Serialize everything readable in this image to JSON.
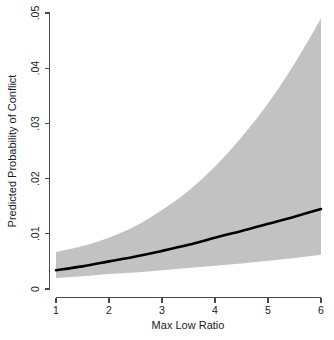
{
  "chart_data": {
    "type": "line",
    "title": "",
    "subtitle": "",
    "xlabel": "Max Low Ratio",
    "ylabel": "Predicted Probability of Conflict",
    "xlim": [
      1,
      6
    ],
    "ylim": [
      0,
      0.05
    ],
    "grid": false,
    "legend": null,
    "x_ticks": [
      1,
      2,
      3,
      4,
      5,
      6
    ],
    "x_tick_labels": [
      "1",
      "2",
      "3",
      "4",
      "5",
      "6"
    ],
    "y_ticks": [
      0,
      0.01,
      0.02,
      0.03,
      0.04,
      0.05
    ],
    "y_tick_labels": [
      "0",
      ".01",
      ".02",
      ".03",
      ".04",
      ".05"
    ],
    "x": [
      1,
      1.5,
      2,
      2.5,
      3,
      3.5,
      4,
      4.5,
      5,
      5.5,
      6
    ],
    "series": [
      {
        "name": "Predicted probability (fit)",
        "type": "line",
        "color": "#000000",
        "line_width": 2.6,
        "values": [
          0.0034,
          0.0041,
          0.005,
          0.0059,
          0.0069,
          0.008,
          0.0093,
          0.0105,
          0.0118,
          0.0131,
          0.0145
        ]
      },
      {
        "name": "Confidence interval upper bound",
        "type": "band-upper",
        "color": "#c2c2c2",
        "values": [
          0.0067,
          0.0078,
          0.0093,
          0.0114,
          0.0143,
          0.0178,
          0.0222,
          0.0275,
          0.0336,
          0.0408,
          0.049
        ]
      },
      {
        "name": "Confidence interval lower bound",
        "type": "band-lower",
        "color": "#c2c2c2",
        "values": [
          0.002,
          0.0023,
          0.0027,
          0.003,
          0.0034,
          0.0038,
          0.0042,
          0.0046,
          0.0051,
          0.0056,
          0.0062
        ]
      }
    ],
    "band_fill_color": "#c2c2c2",
    "axis_color": "#4a4a4a",
    "background_color": "#ffffff"
  },
  "axes": {
    "x_title": "Max Low Ratio",
    "y_title": "Predicted Probability of Conflict",
    "x_tick_labels": [
      "1",
      "2",
      "3",
      "4",
      "5",
      "6"
    ],
    "y_tick_labels": [
      "0",
      ".01",
      ".02",
      ".03",
      ".04",
      ".05"
    ]
  }
}
